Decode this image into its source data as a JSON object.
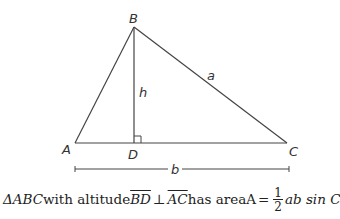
{
  "diagram": {
    "vertices": {
      "A": {
        "label": "A",
        "x": 75,
        "y": 143
      },
      "B": {
        "label": "B",
        "x": 134,
        "y": 27
      },
      "C": {
        "label": "C",
        "x": 287,
        "y": 143
      },
      "D": {
        "label": "D",
        "x": 134,
        "y": 143
      }
    },
    "side_labels": {
      "a": "a",
      "b": "b",
      "h": "h"
    },
    "colors": {
      "stroke": "#444444",
      "text": "#333333"
    }
  },
  "caption": {
    "triangle_symbol": "ΔABC",
    "with_altitude": "with altitude",
    "segment_bd": "BD",
    "perp_symbol": "⊥",
    "segment_ac": "AC",
    "has_area": "has area",
    "area_var": "A",
    "equals": "=",
    "frac_num": "1",
    "frac_den": "2",
    "formula_tail": "ab sin C"
  }
}
